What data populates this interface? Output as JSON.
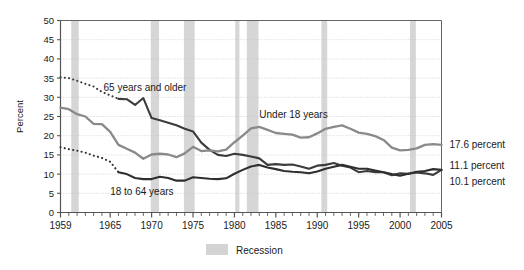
{
  "chart_data": {
    "type": "line",
    "title": "",
    "xlabel": "",
    "ylabel": "Percent",
    "xlim": [
      1959,
      2005
    ],
    "ylim": [
      0,
      50
    ],
    "ytick_step": 5,
    "grid": true,
    "legend_position": "below-center",
    "yticks": [
      "0",
      "5",
      "10",
      "15",
      "20",
      "25",
      "30",
      "35",
      "40",
      "45",
      "50"
    ],
    "xticks": [
      "1959",
      "1965",
      "1970",
      "1975",
      "1980",
      "1985",
      "1990",
      "1995",
      "2000",
      "2005"
    ],
    "xtick_values": [
      1959,
      1965,
      1970,
      1975,
      1980,
      1985,
      1990,
      1995,
      2000,
      2005
    ],
    "minor_tick_interval": 1,
    "annotations": [
      {
        "name": "series-label-65-plus",
        "text": "65 years and older",
        "x": 1964.2,
        "y": 31.6
      },
      {
        "name": "series-label-under-18",
        "text": "Under 18 years",
        "x": 1983.0,
        "y": 24.6
      },
      {
        "name": "series-label-18-to-64",
        "text": "18 to 64 years",
        "x": 1965.0,
        "y": 4.6
      }
    ],
    "end_labels": [
      {
        "name": "end-label-under-18",
        "text": "17.6 percent",
        "value": 17.6
      },
      {
        "name": "end-label-65-plus",
        "text": "11.1 percent",
        "value": 11.1
      },
      {
        "name": "end-label-18-to-64",
        "text": "10.1 percent",
        "value": 10.1
      }
    ],
    "legend": [
      {
        "name": "legend-recession",
        "label": "Recession",
        "color": "#d4d4d4"
      }
    ],
    "recessions": [
      {
        "start": 1960.3,
        "end": 1961.2
      },
      {
        "start": 1969.9,
        "end": 1970.9
      },
      {
        "start": 1973.9,
        "end": 1975.2
      },
      {
        "start": 1980.1,
        "end": 1980.6
      },
      {
        "start": 1981.5,
        "end": 1982.9
      },
      {
        "start": 1990.5,
        "end": 1991.2
      },
      {
        "start": 2001.2,
        "end": 2001.9
      }
    ],
    "series": [
      {
        "name": "65 years and older",
        "color": "#3c3c3c",
        "width": 2.1,
        "dashed_through": 1966,
        "x": [
          1959,
          1960,
          1961,
          1962,
          1963,
          1964,
          1965,
          1966,
          1967,
          1968,
          1969,
          1970,
          1971,
          1972,
          1973,
          1974,
          1975,
          1976,
          1977,
          1978,
          1979,
          1980,
          1981,
          1982,
          1983,
          1984,
          1985,
          1986,
          1987,
          1988,
          1989,
          1990,
          1991,
          1992,
          1993,
          1994,
          1995,
          1996,
          1997,
          1998,
          1999,
          2000,
          2001,
          2002,
          2003,
          2004,
          2005
        ],
        "values": [
          35.2,
          35.0,
          34.3,
          33.5,
          32.8,
          31.4,
          30.5,
          29.6,
          29.5,
          28.0,
          29.8,
          24.6,
          24.0,
          23.4,
          22.7,
          21.8,
          21.1,
          18.2,
          16.3,
          15.0,
          14.7,
          15.3,
          15.0,
          14.6,
          14.1,
          12.4,
          12.6,
          12.4,
          12.5,
          12.0,
          11.4,
          12.2,
          12.4,
          12.9,
          12.2,
          11.7,
          10.5,
          10.8,
          10.5,
          10.5,
          9.7,
          10.2,
          10.1,
          10.4,
          10.2,
          9.8,
          11.1
        ]
      },
      {
        "name": "Under 18 years",
        "color": "#8a8a8a",
        "width": 2.3,
        "dashed_through": null,
        "x": [
          1959,
          1960,
          1961,
          1962,
          1963,
          1964,
          1965,
          1966,
          1967,
          1968,
          1969,
          1970,
          1971,
          1972,
          1973,
          1974,
          1975,
          1976,
          1977,
          1978,
          1979,
          1980,
          1981,
          1982,
          1983,
          1984,
          1985,
          1986,
          1987,
          1988,
          1989,
          1990,
          1991,
          1992,
          1993,
          1994,
          1995,
          1996,
          1997,
          1998,
          1999,
          2000,
          2001,
          2002,
          2003,
          2004,
          2005
        ],
        "values": [
          27.3,
          26.9,
          25.6,
          25.0,
          23.1,
          23.0,
          21.0,
          17.6,
          16.6,
          15.6,
          14.0,
          15.1,
          15.3,
          15.1,
          14.4,
          15.4,
          17.1,
          16.0,
          16.2,
          15.9,
          16.4,
          18.3,
          20.0,
          21.9,
          22.3,
          21.5,
          20.7,
          20.5,
          20.3,
          19.5,
          19.6,
          20.6,
          21.8,
          22.3,
          22.7,
          21.8,
          20.8,
          20.5,
          19.9,
          18.9,
          16.9,
          16.2,
          16.3,
          16.7,
          17.6,
          17.8,
          17.6
        ]
      },
      {
        "name": "18 to 64 years",
        "color": "#2f2f2f",
        "width": 2.1,
        "dashed_through": 1966,
        "x": [
          1959,
          1960,
          1961,
          1962,
          1963,
          1964,
          1965,
          1966,
          1967,
          1968,
          1969,
          1970,
          1971,
          1972,
          1973,
          1974,
          1975,
          1976,
          1977,
          1978,
          1979,
          1980,
          1981,
          1982,
          1983,
          1984,
          1985,
          1986,
          1987,
          1988,
          1989,
          1990,
          1991,
          1992,
          1993,
          1994,
          1995,
          1996,
          1997,
          1998,
          1999,
          2000,
          2001,
          2002,
          2003,
          2004,
          2005
        ],
        "values": [
          17.0,
          16.5,
          16.1,
          15.6,
          14.8,
          14.2,
          13.2,
          10.5,
          10.0,
          9.0,
          8.7,
          8.7,
          9.3,
          9.0,
          8.3,
          8.3,
          9.2,
          9.0,
          8.8,
          8.7,
          8.9,
          10.1,
          11.1,
          12.0,
          12.4,
          11.7,
          11.3,
          10.8,
          10.6,
          10.5,
          10.2,
          10.7,
          11.4,
          11.9,
          12.4,
          11.9,
          11.4,
          11.4,
          10.9,
          10.5,
          10.0,
          9.6,
          10.1,
          10.6,
          10.8,
          11.3,
          11.1
        ]
      }
    ]
  },
  "axis": {
    "y_axis_title": "Percent"
  },
  "legend": {
    "recession_label": "Recession"
  }
}
